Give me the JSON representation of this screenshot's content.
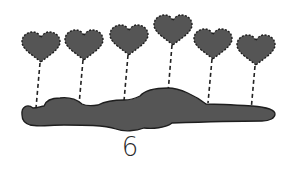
{
  "illustration": {
    "type": "counting-picture",
    "subject": "heart balloons tied to a cloud",
    "count_label": "6",
    "colors": {
      "fill": "#555555",
      "outline": "#222222",
      "background": "#ffffff"
    },
    "balloons": [
      {
        "shape": "heart",
        "cx": 41,
        "cy": 47
      },
      {
        "shape": "heart",
        "cx": 84,
        "cy": 45
      },
      {
        "shape": "heart",
        "cx": 129,
        "cy": 40
      },
      {
        "shape": "heart",
        "cx": 173,
        "cy": 30
      },
      {
        "shape": "heart",
        "cx": 213,
        "cy": 44
      },
      {
        "shape": "heart",
        "cx": 256,
        "cy": 50
      }
    ]
  }
}
